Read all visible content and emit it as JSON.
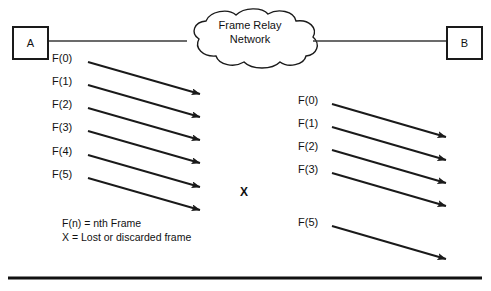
{
  "diagram": {
    "colors": {
      "line": "#1a1a1a",
      "text": "#111111",
      "background": "#ffffff"
    },
    "nodes": {
      "left_label": "A",
      "right_label": "B"
    },
    "cloud": {
      "line1": "Frame Relay",
      "line2": "Network"
    },
    "x_marker": "X",
    "legend": {
      "line1": "F(n) = nth  Frame",
      "line2": "X = Lost or discarded frame"
    },
    "sent_frames": [
      {
        "label": "F(0)",
        "label_x": 52,
        "label_y": 52,
        "x1": 88,
        "y1": 62,
        "x2": 200,
        "y2": 94
      },
      {
        "label": "F(1)",
        "label_x": 52,
        "label_y": 75,
        "x1": 88,
        "y1": 85,
        "x2": 200,
        "y2": 117
      },
      {
        "label": "F(2)",
        "label_x": 52,
        "label_y": 98,
        "x1": 88,
        "y1": 108,
        "x2": 200,
        "y2": 140
      },
      {
        "label": "F(3)",
        "label_x": 52,
        "label_y": 121,
        "x1": 88,
        "y1": 131,
        "x2": 200,
        "y2": 163
      },
      {
        "label": "F(4)",
        "label_x": 52,
        "label_y": 145,
        "x1": 88,
        "y1": 155,
        "x2": 200,
        "y2": 187
      },
      {
        "label": "F(5)",
        "label_x": 52,
        "label_y": 168,
        "x1": 88,
        "y1": 178,
        "x2": 200,
        "y2": 210
      }
    ],
    "received_frames": [
      {
        "label": "F(0)",
        "label_x": 298,
        "label_y": 94,
        "x1": 332,
        "y1": 104,
        "x2": 446,
        "y2": 137
      },
      {
        "label": "F(1)",
        "label_x": 298,
        "label_y": 117,
        "x1": 332,
        "y1": 127,
        "x2": 446,
        "y2": 160
      },
      {
        "label": "F(2)",
        "label_x": 298,
        "label_y": 140,
        "x1": 332,
        "y1": 150,
        "x2": 446,
        "y2": 183
      },
      {
        "label": "F(3)",
        "label_x": 298,
        "label_y": 163,
        "x1": 332,
        "y1": 173,
        "x2": 446,
        "y2": 206
      },
      {
        "label": "F(5)",
        "label_x": 298,
        "label_y": 216,
        "x1": 332,
        "y1": 226,
        "x2": 446,
        "y2": 259
      }
    ],
    "links": [
      {
        "name": "link-a-to-cloud",
        "x1": 46,
        "y1": 41,
        "x2": 187,
        "y2": 41
      },
      {
        "name": "link-cloud-to-b",
        "x1": 313,
        "y1": 41,
        "x2": 446,
        "y2": 41
      }
    ],
    "baseline": {
      "x1": 8,
      "y1": 278,
      "x2": 482,
      "y2": 278
    }
  }
}
